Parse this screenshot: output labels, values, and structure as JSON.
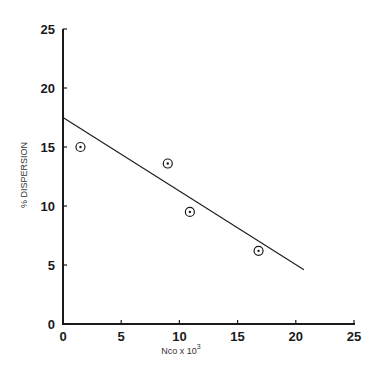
{
  "chart_data": {
    "type": "scatter",
    "title": "",
    "xlabel": "Nco x 10",
    "xlabel_superscript": "3",
    "ylabel": "% DISPERSION",
    "xlim": [
      0,
      25
    ],
    "ylim": [
      0,
      25
    ],
    "grid": false,
    "legend": null,
    "x_ticks": [
      "0",
      "5",
      "10",
      "15",
      "20",
      "25"
    ],
    "y_ticks": [
      "0",
      "5",
      "10",
      "15",
      "20",
      "25"
    ],
    "series": [
      {
        "name": "measured",
        "marker": "circled-dot",
        "points": [
          {
            "x": 1.5,
            "y": 15.0
          },
          {
            "x": 9.0,
            "y": 13.6
          },
          {
            "x": 10.9,
            "y": 9.5
          },
          {
            "x": 16.8,
            "y": 6.2
          }
        ]
      },
      {
        "name": "fit",
        "type": "line",
        "points": [
          {
            "x": 0,
            "y": 17.5
          },
          {
            "x": 20.7,
            "y": 4.6
          }
        ]
      }
    ]
  },
  "colors": {
    "ink": "#1a1a1a",
    "background": "#ffffff"
  }
}
